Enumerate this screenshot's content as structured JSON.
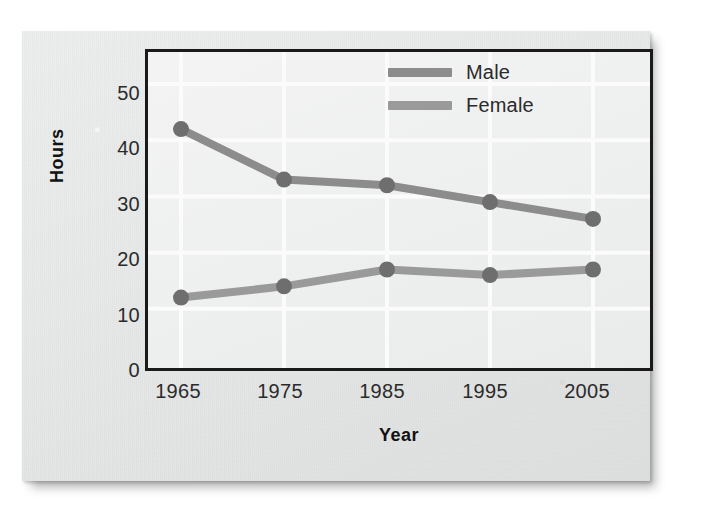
{
  "chart_data": {
    "type": "line",
    "title": "",
    "xlabel": "Year",
    "ylabel": "Hours",
    "categories": [
      "1965",
      "1975",
      "1985",
      "1995",
      "2005"
    ],
    "x": [
      1965,
      1975,
      1985,
      1995,
      2005
    ],
    "series": [
      {
        "name": "Male",
        "values": [
          42,
          33,
          32,
          29,
          26
        ],
        "color": "#8c8c8c",
        "marker_color": "#6e6e6e"
      },
      {
        "name": "Female",
        "values": [
          12,
          14,
          17,
          16,
          17
        ],
        "color": "#9a9a9a",
        "marker_color": "#6e6e6e"
      }
    ],
    "xlim": [
      1960,
      2010
    ],
    "ylim": [
      0,
      55
    ],
    "yticks": [
      "0",
      "10",
      "20",
      "30",
      "40",
      "50"
    ],
    "ytick_values": [
      0,
      10,
      20,
      30,
      40,
      50
    ],
    "grid": true,
    "grid_color": "#fbfbfb",
    "legend_position": "top-center",
    "plot_background": "#efefef",
    "frame_color": "#1a1a1a"
  },
  "legend": {
    "entries": [
      {
        "label": "Male"
      },
      {
        "label": "Female"
      }
    ]
  },
  "axes": {
    "y_title": "Hours",
    "x_title": "Year"
  }
}
